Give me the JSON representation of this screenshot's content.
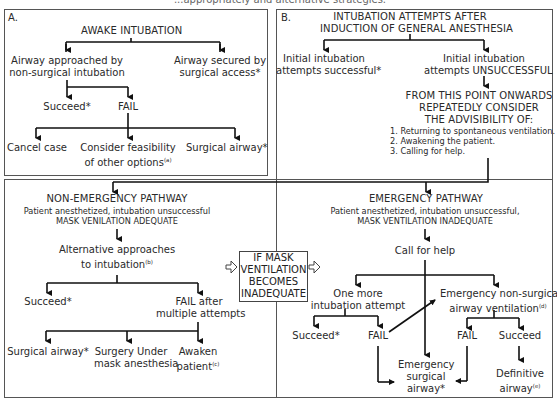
{
  "header": {
    "partial_title": "...appropriately and alternative strategies."
  },
  "panel_a": {
    "label": "A.",
    "title": "AWAKE INTUBATION",
    "left_branch": [
      "Airway approached by",
      "non-surgical intubation"
    ],
    "right_branch": [
      "Airway secured by",
      "surgical access*"
    ],
    "succeed": "Succeed*",
    "fail": "FAIL",
    "options": {
      "cancel": "Cancel case",
      "consider": [
        "Consider feasibility",
        "of other options"
      ],
      "consider_note": "(a)",
      "surgical": "Surgical airway*"
    }
  },
  "panel_b": {
    "label": "B.",
    "title": [
      "INTUBATION ATTEMPTS AFTER",
      "INDUCTION OF GENERAL ANESTHESIA"
    ],
    "success": [
      "Initial intubation",
      "attempts successful*"
    ],
    "unsuccess": [
      "Initial intubation",
      "attempts UNSUCCESSFUL"
    ],
    "consider": [
      "FROM THIS POINT ONWARDS",
      "REPEATEDLY CONSIDER",
      "THE ADVISIBILITY OF:"
    ],
    "consider_list": [
      "1. Returning to spontaneous ventilation.",
      "2. Awakening the patient.",
      "3. Calling for help."
    ]
  },
  "non_emergency": {
    "title": "NON-EMERGENCY PATHWAY",
    "desc": [
      "Patient anesthetized, intubation unsuccessful",
      "MASK VENILATION ADEQUATE"
    ],
    "alt": [
      "Alternative approaches",
      "to intubation"
    ],
    "alt_note": "(b)",
    "succeed": "Succeed*",
    "fail": [
      "FAIL after",
      "multiple attempts"
    ],
    "options": {
      "surgical": "Surgical airway*",
      "mask": [
        "Surgery Under",
        "mask anesthesia"
      ],
      "awaken": [
        "Awaken",
        "patient"
      ],
      "awaken_note": "(c)"
    }
  },
  "transition": [
    "IF MASK",
    "VENTILATION",
    "BECOMES",
    "INADEQUATE"
  ],
  "emergency": {
    "title": "EMERGENCY PATHWAY",
    "desc": [
      "Patient anesthetized, intubation unsuccessful,",
      "MASK VENTILATION INADEQUATE"
    ],
    "call": "Call for help",
    "one_more": [
      "One more",
      "intubation attempt"
    ],
    "nonsurgical": [
      "Emergency non-surgical",
      "airway ventilation"
    ],
    "nonsurgical_note": "(d)",
    "succeed_left": "Succeed*",
    "fail_left": "FAIL",
    "fail_right": "FAIL",
    "succeed_right": "Succeed",
    "surgical": [
      "Emergency",
      "surgical",
      "airway*"
    ],
    "definitive": [
      "Definitive",
      "airway"
    ],
    "definitive_note": "(e)"
  }
}
